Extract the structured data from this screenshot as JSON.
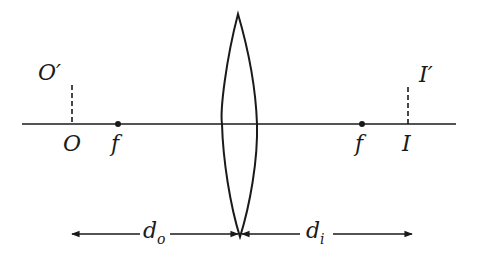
{
  "diagram": {
    "colors": {
      "stroke": "#1a1a1a",
      "background": "#ffffff"
    },
    "axis": {
      "x1": 22,
      "x2": 456,
      "y": 124
    },
    "lens": {
      "top": [
        238,
        14
      ],
      "bottom": [
        240,
        237
      ],
      "left_x": 222,
      "right_x": 257
    },
    "object": {
      "label": "O",
      "top_label": "O′",
      "x": 72,
      "top_y": 85
    },
    "image": {
      "label": "I",
      "top_label": "I′",
      "x": 408,
      "top_y": 87
    },
    "focal_points": [
      {
        "label": "f",
        "x": 118
      },
      {
        "label": "f",
        "x": 362
      }
    ],
    "distances": {
      "object": {
        "label": "d",
        "subscript": "o",
        "from_x": 72,
        "to_x": 240,
        "y": 234
      },
      "image": {
        "label": "d",
        "subscript": "i",
        "from_x": 240,
        "to_x": 412,
        "y": 234
      }
    }
  }
}
